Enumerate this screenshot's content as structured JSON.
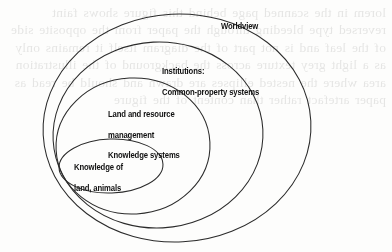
{
  "figure": {
    "type": "nested-ellipse-diagram",
    "caption_visible": false,
    "background_color": "#fdfdfc",
    "stroke_color": "#2b2b2b",
    "text_color": "#111111",
    "levels": [
      {
        "id": "worldview",
        "rank": 1,
        "scope": "outermost",
        "label": "Worldview",
        "lines": [
          "Worldview"
        ]
      },
      {
        "id": "institutions",
        "rank": 2,
        "scope": "second",
        "label": "Institutions: Common-property systems",
        "lines": [
          "Institutions:",
          "Common-property systems"
        ]
      },
      {
        "id": "land-resource-management",
        "rank": 3,
        "scope": "third",
        "label": "Land and resource management Knowledge systems",
        "lines": [
          "Land and resource",
          "management",
          "Knowledge systems"
        ]
      },
      {
        "id": "knowledge-of-land-animals",
        "rank": 4,
        "scope": "innermost",
        "label": "Knowledge of land, animals",
        "lines": [
          "Knowledge of",
          "land, animals"
        ]
      }
    ]
  },
  "page_bleed_text": "lorem in the scanned page behind this figure shows faint reversed type bleeding through the paper from the opposite side of the leaf and is not part of the diagram itself it remains only as a light grey texture across the background of the illustration area where the nested ellipses are drawn and should be read as paper artefact rather than content of the figure"
}
